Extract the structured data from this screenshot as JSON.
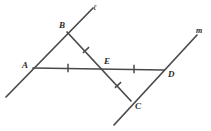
{
  "figure": {
    "type": "geometry-diagram",
    "width": 211,
    "height": 131,
    "background_color": "#ffffff",
    "stroke_color": "#4a4a4a",
    "label_color": "#2b2b2b"
  },
  "lines": [
    {
      "id": "line-l",
      "label": "ℓ",
      "label_x": 93,
      "label_y": 4,
      "x1": 6,
      "y1": 97,
      "x2": 93,
      "y2": 8
    },
    {
      "id": "line-m",
      "label": "m",
      "label_x": 196,
      "label_y": 27,
      "x1": 114,
      "y1": 125,
      "x2": 197,
      "y2": 35
    }
  ],
  "segments": [
    {
      "id": "segment-AD",
      "from": "A",
      "to": "D",
      "x1": 33,
      "y1": 68,
      "x2": 164,
      "y2": 70
    },
    {
      "id": "segment-BC",
      "from": "B",
      "to": "C",
      "x1": 67,
      "y1": 32,
      "x2": 131,
      "y2": 101
    }
  ],
  "points": [
    {
      "id": "point-A",
      "label": "A",
      "x": 33,
      "y": 68,
      "label_x": 22,
      "label_y": 61
    },
    {
      "id": "point-B",
      "label": "B",
      "x": 67,
      "y": 32,
      "label_x": 59,
      "label_y": 21
    },
    {
      "id": "point-C",
      "label": "C",
      "x": 131,
      "y": 101,
      "label_x": 135,
      "label_y": 102
    },
    {
      "id": "point-D",
      "label": "D",
      "x": 164,
      "y": 70,
      "label_x": 168,
      "label_y": 70
    },
    {
      "id": "point-E",
      "label": "E",
      "x": 105,
      "y": 68,
      "label_x": 104,
      "label_y": 57
    }
  ],
  "tick_marks": [
    {
      "id": "tick-AE",
      "on_segment": "AE",
      "count": 1,
      "x": 68,
      "y": 68,
      "angle": 0
    },
    {
      "id": "tick-ED",
      "on_segment": "ED",
      "count": 1,
      "x": 134,
      "y": 69,
      "angle": 0
    },
    {
      "id": "tick-BE",
      "on_segment": "BE",
      "count": 1,
      "x": 86,
      "y": 50,
      "angle": 47
    },
    {
      "id": "tick-EC",
      "on_segment": "EC",
      "count": 1,
      "x": 118,
      "y": 85,
      "angle": 47
    }
  ]
}
